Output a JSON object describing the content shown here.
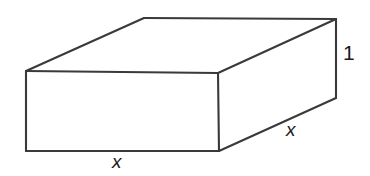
{
  "figure": {
    "name": "rectangular-box",
    "background_color": "#ffffff",
    "line_color": "#3a3a3a",
    "label_color": "#1a1a1a",
    "line_width": 2.1
  },
  "labels": {
    "height": "1",
    "depth": "x",
    "width": "x"
  },
  "geometry": {
    "front_top_left": [
      26,
      71
    ],
    "front_top_right": [
      218,
      73
    ],
    "front_bottom_right": [
      219,
      151
    ],
    "front_bottom_left": [
      26,
      151
    ],
    "back_top_left": [
      144,
      18
    ],
    "back_top_right": [
      336,
      19
    ],
    "back_bottom_right": [
      336,
      98
    ],
    "front_face_path": "M 26 71 L 218 73 L 219 151 L 26 151 Z",
    "top_face_path": "M 26 71 L 144 18 L 336 19 L 218 73 Z",
    "right_face_path": "M 218 73 L 336 19 L 336 98 L 219 151 Z"
  }
}
